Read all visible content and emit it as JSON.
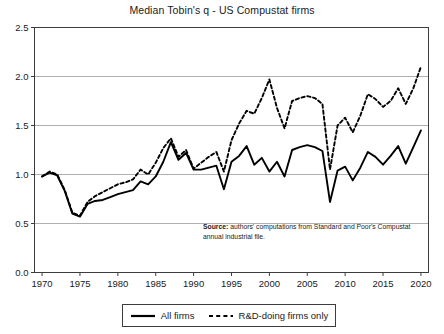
{
  "chart_data": {
    "type": "line",
    "title": "Median Tobin's q - US Compustat firms",
    "xlabel": "",
    "ylabel": "",
    "xlim": [
      1969,
      2021
    ],
    "ylim": [
      0.0,
      2.5
    ],
    "grid": true,
    "legend_position": "below-axes",
    "xticks": [
      1970,
      1975,
      1980,
      1985,
      1990,
      1995,
      2000,
      2005,
      2010,
      2015,
      2020
    ],
    "yticks": [
      "0.0",
      "0.5",
      "1.0",
      "1.5",
      "2.0",
      "2.5"
    ],
    "x": [
      1970,
      1971,
      1972,
      1973,
      1974,
      1975,
      1976,
      1977,
      1978,
      1979,
      1980,
      1981,
      1982,
      1983,
      1984,
      1985,
      1986,
      1987,
      1988,
      1989,
      1990,
      1991,
      1992,
      1993,
      1994,
      1995,
      1996,
      1997,
      1998,
      1999,
      2000,
      2001,
      2002,
      2003,
      2004,
      2005,
      2006,
      2007,
      2008,
      2009,
      2010,
      2011,
      2012,
      2013,
      2014,
      2015,
      2016,
      2017,
      2018,
      2019,
      2020
    ],
    "series": [
      {
        "name": "All firms",
        "style": "solid",
        "color": "#000000",
        "values": [
          0.98,
          1.02,
          0.99,
          0.83,
          0.6,
          0.57,
          0.7,
          0.73,
          0.74,
          0.77,
          0.8,
          0.82,
          0.84,
          0.93,
          0.9,
          0.98,
          1.13,
          1.33,
          1.15,
          1.22,
          1.05,
          1.05,
          1.07,
          1.09,
          0.85,
          1.13,
          1.19,
          1.29,
          1.1,
          1.17,
          1.03,
          1.13,
          0.98,
          1.25,
          1.28,
          1.3,
          1.28,
          1.24,
          0.72,
          1.04,
          1.08,
          0.94,
          1.07,
          1.23,
          1.18,
          1.1,
          1.19,
          1.29,
          1.11,
          1.28,
          1.45
        ]
      },
      {
        "name": "R&D-doing firms only",
        "style": "dashed",
        "color": "#000000",
        "values": [
          0.98,
          1.03,
          1.0,
          0.84,
          0.61,
          0.58,
          0.72,
          0.78,
          0.82,
          0.86,
          0.9,
          0.92,
          0.95,
          1.05,
          1.0,
          1.12,
          1.27,
          1.37,
          1.18,
          1.25,
          1.06,
          1.12,
          1.18,
          1.23,
          1.03,
          1.35,
          1.52,
          1.65,
          1.62,
          1.78,
          1.97,
          1.68,
          1.47,
          1.75,
          1.78,
          1.8,
          1.78,
          1.72,
          1.05,
          1.5,
          1.58,
          1.43,
          1.6,
          1.82,
          1.77,
          1.69,
          1.75,
          1.88,
          1.72,
          1.88,
          2.1
        ]
      }
    ],
    "annotations": [
      {
        "name": "source-note",
        "bold_prefix": "Source:",
        "text": " authors' computations from Standard and Poor's Compustat annual industrial file."
      }
    ]
  },
  "legend": {
    "entries": [
      {
        "label": "All firms"
      },
      {
        "label": "R&D-doing firms only"
      }
    ]
  }
}
